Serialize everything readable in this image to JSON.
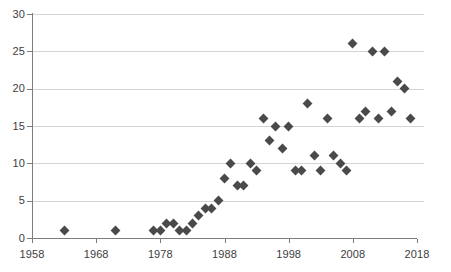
{
  "chart_data": {
    "type": "scatter",
    "title": "",
    "subtitle": "",
    "xlabel": "",
    "ylabel": "",
    "xlim": [
      1958,
      2018
    ],
    "ylim": [
      0,
      30
    ],
    "grid": "horizontal",
    "legend": "none",
    "marker": {
      "shape": "diamond",
      "color": "#4a4a4a",
      "size": 7
    },
    "axis": {
      "x_ticks": [
        1958,
        1968,
        1978,
        1988,
        1998,
        2008,
        2018
      ],
      "x_tick_labels": [
        "1958",
        "1968",
        "1978",
        "1988",
        "1998",
        "2008",
        "2018"
      ],
      "y_ticks": [
        0,
        5,
        10,
        15,
        20,
        25,
        30
      ],
      "y_tick_labels": [
        "0",
        "5",
        "10",
        "15",
        "20",
        "25",
        "30"
      ],
      "gridline_color": "#d4d4d4",
      "axis_color": "#7d7d7d",
      "tick_label_color": "#3d3d3d"
    },
    "x": [
      1963,
      1971,
      1977,
      1978,
      1979,
      1980,
      1981,
      1982,
      1983,
      1984,
      1985,
      1986,
      1987,
      1988,
      1989,
      1990,
      1991,
      1992,
      1993,
      1994,
      1995,
      1996,
      1997,
      1998,
      1999,
      2000,
      2001,
      2002,
      2003,
      2004,
      2005,
      2006,
      2007,
      2008,
      2009,
      2010,
      2011,
      2012,
      2013,
      2014,
      2015,
      2016,
      2017
    ],
    "y": [
      1,
      1,
      1,
      1,
      2,
      2,
      1,
      1,
      2,
      3,
      4,
      4,
      5,
      8,
      10,
      7,
      7,
      10,
      9,
      16,
      13,
      15,
      12,
      15,
      9,
      9,
      18,
      11,
      9,
      16,
      11,
      10,
      9,
      26,
      16,
      17,
      25,
      16,
      25,
      17,
      21,
      20,
      16
    ],
    "points": [
      {
        "x": 1963,
        "y": 1
      },
      {
        "x": 1971,
        "y": 1
      },
      {
        "x": 1977,
        "y": 1
      },
      {
        "x": 1978,
        "y": 1
      },
      {
        "x": 1979,
        "y": 2
      },
      {
        "x": 1980,
        "y": 2
      },
      {
        "x": 1981,
        "y": 1
      },
      {
        "x": 1982,
        "y": 1
      },
      {
        "x": 1983,
        "y": 2
      },
      {
        "x": 1984,
        "y": 3
      },
      {
        "x": 1985,
        "y": 4
      },
      {
        "x": 1986,
        "y": 4
      },
      {
        "x": 1987,
        "y": 5
      },
      {
        "x": 1988,
        "y": 8
      },
      {
        "x": 1989,
        "y": 10
      },
      {
        "x": 1990,
        "y": 7
      },
      {
        "x": 1991,
        "y": 7
      },
      {
        "x": 1992,
        "y": 10
      },
      {
        "x": 1993,
        "y": 9
      },
      {
        "x": 1994,
        "y": 16
      },
      {
        "x": 1995,
        "y": 13
      },
      {
        "x": 1996,
        "y": 15
      },
      {
        "x": 1997,
        "y": 12
      },
      {
        "x": 1998,
        "y": 15
      },
      {
        "x": 1999,
        "y": 9
      },
      {
        "x": 2000,
        "y": 9
      },
      {
        "x": 2001,
        "y": 18
      },
      {
        "x": 2002,
        "y": 11
      },
      {
        "x": 2003,
        "y": 9
      },
      {
        "x": 2004,
        "y": 16
      },
      {
        "x": 2005,
        "y": 11
      },
      {
        "x": 2006,
        "y": 10
      },
      {
        "x": 2007,
        "y": 9
      },
      {
        "x": 2008,
        "y": 26
      },
      {
        "x": 2009,
        "y": 16
      },
      {
        "x": 2010,
        "y": 17
      },
      {
        "x": 2011,
        "y": 25
      },
      {
        "x": 2012,
        "y": 16
      },
      {
        "x": 2013,
        "y": 25
      },
      {
        "x": 2014,
        "y": 17
      },
      {
        "x": 2015,
        "y": 21
      },
      {
        "x": 2016,
        "y": 20
      },
      {
        "x": 2017,
        "y": 16
      }
    ]
  }
}
